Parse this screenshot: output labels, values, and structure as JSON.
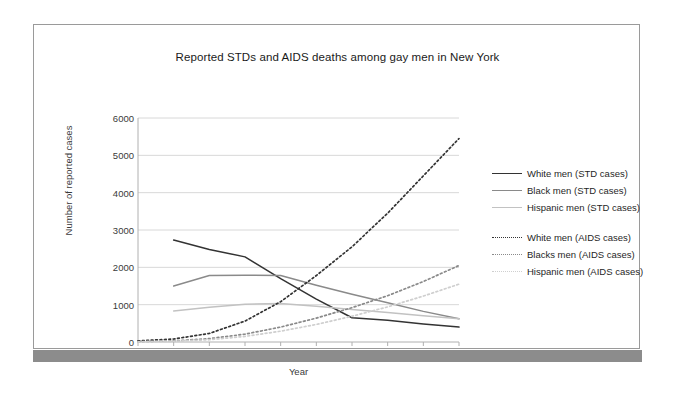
{
  "chart_data": {
    "type": "line",
    "title": "Reported STDs and AIDS deaths among gay men in New York",
    "xlabel": "Year",
    "ylabel": "Number of reported cases",
    "x": [
      1980,
      1981,
      1982,
      1983,
      1984,
      1985,
      1986,
      1987,
      1988,
      1989
    ],
    "xtick_labels": [
      "1980",
      "1981",
      "1982",
      "1983",
      "1984",
      "1985",
      "1986",
      "1987",
      "1988",
      "1989"
    ],
    "ytick_labels": [
      "0",
      "1000",
      "2000",
      "3000",
      "4000",
      "5000",
      "6000"
    ],
    "ytick_values": [
      0,
      1000,
      2000,
      3000,
      4000,
      5000,
      6000
    ],
    "xlim": [
      1980,
      1989
    ],
    "ylim": [
      0,
      6000
    ],
    "grid": "horizontal",
    "legend_position": "right",
    "series": [
      {
        "name": "White men (STD cases)",
        "style": "solid",
        "color": "#333333",
        "x": [
          1981,
          1982,
          1983,
          1984,
          1985,
          1986,
          1987,
          1988,
          1989
        ],
        "values": [
          2730,
          2480,
          2280,
          1700,
          1150,
          650,
          580,
          480,
          400
        ]
      },
      {
        "name": "Black men (STD cases)",
        "style": "solid",
        "color": "#8a8a8a",
        "x": [
          1981,
          1982,
          1983,
          1984,
          1985,
          1986,
          1987,
          1988,
          1989
        ],
        "values": [
          1500,
          1780,
          1790,
          1780,
          1520,
          1280,
          1050,
          820,
          620
        ]
      },
      {
        "name": "Hispanic men (STD cases)",
        "style": "solid",
        "color": "#c2c2c2",
        "x": [
          1981,
          1982,
          1983,
          1984,
          1985,
          1986,
          1987,
          1988,
          1989
        ],
        "values": [
          830,
          930,
          1010,
          1030,
          960,
          870,
          790,
          700,
          620
        ]
      },
      {
        "name": "White men (AIDS cases)",
        "style": "dotted",
        "color": "#333333",
        "x": [
          1980,
          1981,
          1982,
          1983,
          1984,
          1985,
          1986,
          1987,
          1988,
          1989
        ],
        "values": [
          30,
          80,
          230,
          560,
          1080,
          1780,
          2550,
          3450,
          4450,
          5450
        ]
      },
      {
        "name": "Blacks men (AIDS cases)",
        "style": "dotted",
        "color": "#8a8a8a",
        "x": [
          1980,
          1981,
          1982,
          1983,
          1984,
          1985,
          1986,
          1987,
          1988,
          1989
        ],
        "values": [
          10,
          30,
          90,
          210,
          400,
          640,
          920,
          1240,
          1620,
          2050
        ]
      },
      {
        "name": "Hispanic men (AIDS cases)",
        "style": "dotted",
        "color": "#cfcfcf",
        "x": [
          1980,
          1981,
          1982,
          1983,
          1984,
          1985,
          1986,
          1987,
          1988,
          1989
        ],
        "values": [
          5,
          20,
          60,
          150,
          290,
          470,
          690,
          940,
          1230,
          1550
        ]
      }
    ]
  },
  "legend": {
    "groups": [
      {
        "items": [
          {
            "label": "White men (STD cases)",
            "color": "#333333",
            "style": "solid"
          },
          {
            "label": "Black men (STD cases)",
            "color": "#8a8a8a",
            "style": "solid"
          },
          {
            "label": "Hispanic men (STD cases)",
            "color": "#c2c2c2",
            "style": "solid"
          }
        ]
      },
      {
        "items": [
          {
            "label": "White men (AIDS cases)",
            "color": "#333333",
            "style": "dotted"
          },
          {
            "label": "Blacks men (AIDS cases)",
            "color": "#8a8a8a",
            "style": "dotted"
          },
          {
            "label": "Hispanic men (AIDS cases)",
            "color": "#cfcfcf",
            "style": "dotted"
          }
        ]
      }
    ]
  },
  "colors": {
    "page_border": "#9a9a9a",
    "footer_band": "#8c8c8c",
    "gridline": "#d8d8d8",
    "axis": "#b0b0b0",
    "text": "#1a1a1a"
  }
}
